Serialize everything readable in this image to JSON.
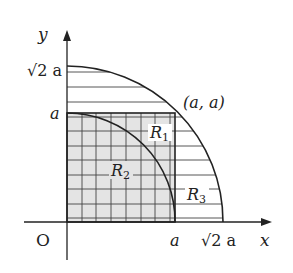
{
  "diagram": {
    "axes": {
      "x_label": "x",
      "y_label": "y",
      "origin_label": "O"
    },
    "y_ticks": [
      {
        "label": "√2 a"
      },
      {
        "label": "a"
      }
    ],
    "x_ticks": [
      {
        "label": "a"
      },
      {
        "label": "√2 a"
      }
    ],
    "point_label": "(a, a)",
    "regions": [
      {
        "name": "R1",
        "main": "R",
        "sub": "1"
      },
      {
        "name": "R2",
        "main": "R",
        "sub": "2"
      },
      {
        "name": "R3",
        "main": "R",
        "sub": "3"
      }
    ],
    "colors": {
      "line": "#222222",
      "square_fill": "#e4e4e4",
      "hatch": "#444444"
    }
  }
}
